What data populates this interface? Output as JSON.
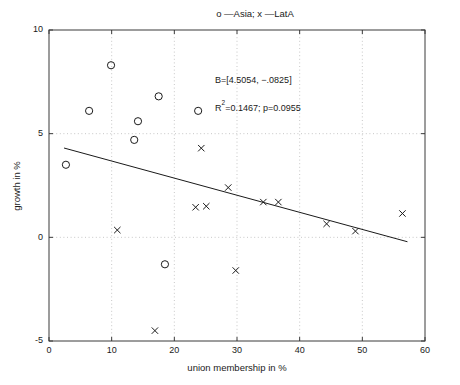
{
  "chart_data": {
    "type": "scatter",
    "title": "o —Asia; x —LatA",
    "xlabel": "union membership in %",
    "ylabel": "growth in %",
    "xlim": [
      0,
      60
    ],
    "ylim": [
      -5,
      10
    ],
    "xticks": [
      0,
      10,
      20,
      30,
      40,
      50,
      60
    ],
    "yticks": [
      -5,
      0,
      5,
      10
    ],
    "xtick_labels": [
      "0",
      "10",
      "20",
      "30",
      "40",
      "50",
      "60"
    ],
    "ytick_labels": [
      "-5",
      "0",
      "5",
      "10"
    ],
    "grid": true,
    "grid_style": "dotted",
    "legend": "in-title",
    "series": [
      {
        "name": "Asia",
        "marker": "o",
        "points": [
          {
            "x": 2.7,
            "y": 3.5
          },
          {
            "x": 6.4,
            "y": 6.1
          },
          {
            "x": 9.9,
            "y": 8.3
          },
          {
            "x": 13.6,
            "y": 4.7
          },
          {
            "x": 14.2,
            "y": 5.6
          },
          {
            "x": 17.5,
            "y": 6.8
          },
          {
            "x": 23.8,
            "y": 6.1
          },
          {
            "x": 18.5,
            "y": -1.3
          }
        ]
      },
      {
        "name": "LatA",
        "marker": "x",
        "points": [
          {
            "x": 10.9,
            "y": 0.35
          },
          {
            "x": 16.9,
            "y": -4.5
          },
          {
            "x": 24.3,
            "y": 4.3
          },
          {
            "x": 23.4,
            "y": 1.45
          },
          {
            "x": 25.1,
            "y": 1.5
          },
          {
            "x": 28.6,
            "y": 2.4
          },
          {
            "x": 29.8,
            "y": -1.6
          },
          {
            "x": 34.2,
            "y": 1.7
          },
          {
            "x": 36.6,
            "y": 1.7
          },
          {
            "x": 44.3,
            "y": 0.65
          },
          {
            "x": 48.9,
            "y": 0.3
          },
          {
            "x": 56.4,
            "y": 1.15
          }
        ]
      }
    ],
    "fit_line": {
      "name": "regression-line",
      "intercept": 4.5054,
      "slope": -0.0825,
      "x_start": 2.4,
      "x_end": 57.2
    },
    "annotations": [
      {
        "name": "coefficients",
        "text": "B=[4.5054, −.0825]",
        "x": 26.5,
        "y": 7.45
      },
      {
        "name": "fit-statistics",
        "text": "R",
        "sup": "2",
        "rest": "=0.1467; p=0.0955",
        "x": 26.5,
        "y": 6.1
      }
    ]
  }
}
